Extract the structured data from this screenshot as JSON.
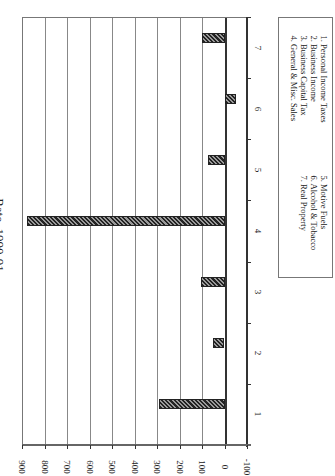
{
  "chart_data": {
    "type": "bar",
    "orientation": "rotated 90 degrees (vertical bars rendered sideways)",
    "title": "Rate, 1990-91",
    "categories": [
      "1",
      "2",
      "3",
      "4",
      "5",
      "6",
      "7"
    ],
    "values": [
      290,
      53,
      105,
      880,
      75,
      -50,
      100
    ],
    "xlabel": "",
    "ylabel": "",
    "ylim": [
      -100,
      900
    ],
    "yticks": [
      900,
      800,
      700,
      600,
      500,
      400,
      300,
      200,
      100,
      0,
      -100
    ],
    "grid": true,
    "legend_position": "right",
    "legend": [
      "1. Personal Income Taxes",
      "2. Business Income",
      "3. Business Capital Tax",
      "4. General & Misc. Sales",
      "5. Motive Fuels",
      "6. Alcohol & Tobacco",
      "7. Real Property"
    ]
  },
  "title": "Rate, 1990-91",
  "yticks": [
    "900",
    "800",
    "700",
    "600",
    "500",
    "400",
    "300",
    "200",
    "100",
    "0",
    "-100"
  ],
  "categories": [
    "1",
    "2",
    "3",
    "4",
    "5",
    "6",
    "7"
  ],
  "legend": {
    "col1": [
      "1.  Personal Income Taxes",
      "2.  Business Income",
      "3.  Business Capital Tax",
      "4.  General & Misc. Sales"
    ],
    "col2": [
      "5.  Motive Fuels",
      "6.  Alcohol & Tobacco",
      "7.  Real Property"
    ]
  },
  "colors": {
    "bar_fill": "#555555",
    "bar_hatch": "#222222",
    "grid": "#888888",
    "axis": "#333333"
  }
}
